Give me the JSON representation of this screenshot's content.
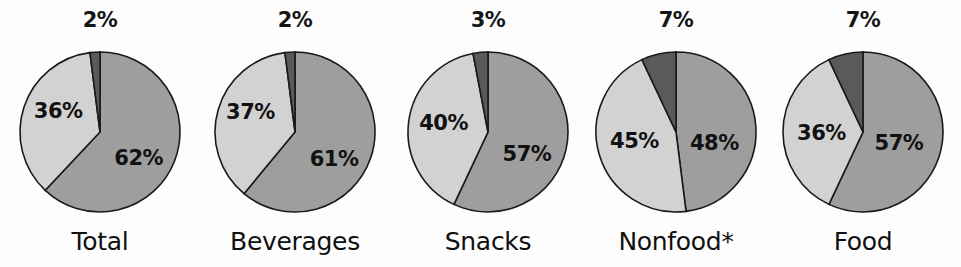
{
  "chart_data": {
    "type": "pie",
    "title": "",
    "subtitle": "",
    "xlabel": "",
    "ylabel": "",
    "legend_position": "none",
    "grid": false,
    "panel_count": 5,
    "series_names": [
      "Large share",
      "Medium share",
      "Small share"
    ],
    "panels": [
      {
        "label": "Total",
        "top_value_label": "2%",
        "slices": [
          {
            "name": "Large share",
            "value": 62,
            "label": "62%",
            "color": "#9e9e9e"
          },
          {
            "name": "Medium share",
            "value": 36,
            "label": "36%",
            "color": "#d2d2d2"
          },
          {
            "name": "Small share",
            "value": 2,
            "label": "2%",
            "color": "#5a5a5a"
          }
        ]
      },
      {
        "label": "Beverages",
        "top_value_label": "2%",
        "slices": [
          {
            "name": "Large share",
            "value": 61,
            "label": "61%",
            "color": "#9e9e9e"
          },
          {
            "name": "Medium share",
            "value": 37,
            "label": "37%",
            "color": "#d2d2d2"
          },
          {
            "name": "Small share",
            "value": 2,
            "label": "2%",
            "color": "#5a5a5a"
          }
        ]
      },
      {
        "label": "Snacks",
        "top_value_label": "3%",
        "slices": [
          {
            "name": "Large share",
            "value": 57,
            "label": "57%",
            "color": "#9e9e9e"
          },
          {
            "name": "Medium share",
            "value": 40,
            "label": "40%",
            "color": "#d2d2d2"
          },
          {
            "name": "Small share",
            "value": 3,
            "label": "3%",
            "color": "#5a5a5a"
          }
        ]
      },
      {
        "label": "Nonfood*",
        "top_value_label": "7%",
        "slices": [
          {
            "name": "Large share",
            "value": 48,
            "label": "48%",
            "color": "#9e9e9e"
          },
          {
            "name": "Medium share",
            "value": 45,
            "label": "45%",
            "color": "#d2d2d2"
          },
          {
            "name": "Small share",
            "value": 7,
            "label": "7%",
            "color": "#5a5a5a"
          }
        ]
      },
      {
        "label": "Food",
        "top_value_label": "7%",
        "slices": [
          {
            "name": "Large share",
            "value": 57,
            "label": "57%",
            "color": "#9e9e9e"
          },
          {
            "name": "Medium share",
            "value": 36,
            "label": "36%",
            "color": "#d2d2d2"
          },
          {
            "name": "Small share",
            "value": 7,
            "label": "7%",
            "color": "#5a5a5a"
          }
        ]
      }
    ],
    "colors": {
      "large_share": "#9e9e9e",
      "medium_share": "#d2d2d2",
      "small_share": "#5a5a5a",
      "outline": "#1a1a1a",
      "text": "#111111",
      "background": "#fdfdfd"
    },
    "layout": {
      "centers_x": [
        100,
        295,
        488,
        676,
        863
      ],
      "center_y": 132,
      "radius": 80,
      "top_label_y": 26,
      "category_label_y": 240
    }
  }
}
